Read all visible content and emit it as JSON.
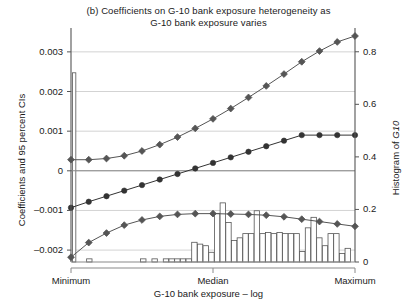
{
  "chart_data": {
    "type": "line",
    "title": "(b)  Coefficients on G-10 bank exposure heterogeneity as",
    "title_line1": "(b)  Coefficients on G-10 bank exposure heterogeneity as",
    "title_line2": "G-10 bank exposure varies",
    "xlabel": "G-10 bank exposure – log",
    "ylabel": "Coefficients and 95 percent CIs",
    "ylabel_right": "Histogram of G10",
    "ylabel_right_plain": "Histogram of ",
    "ylabel_right_italic": "G10",
    "grid": true,
    "legend": "none",
    "xtick_labels": [
      "Minimum",
      "Median",
      "Maximum"
    ],
    "xtick_positions": [
      0,
      0.5,
      1
    ],
    "ylim_left": [
      -0.0023,
      0.0034
    ],
    "ytick_values_left": [
      0.003,
      0.002,
      0.001,
      0,
      -0.001,
      -0.002
    ],
    "ytick_labels_left": [
      "0.003",
      "0.002",
      "0.001",
      "0",
      "–0.001",
      "–0.002"
    ],
    "ylim_right": [
      0,
      0.86
    ],
    "ytick_values_right": [
      0.8,
      0.6,
      0.4,
      0.2,
      0
    ],
    "ytick_labels_right": [
      "0.8",
      "0.6",
      "0.4",
      "0.2",
      "0"
    ],
    "zero_line": 0,
    "series": [
      {
        "name": "Upper 95% CI",
        "marker": "diamond",
        "color": "#555555",
        "x": [
          0.0,
          0.0625,
          0.125,
          0.1875,
          0.25,
          0.3125,
          0.375,
          0.4375,
          0.5,
          0.5625,
          0.625,
          0.6875,
          0.75,
          0.8125,
          0.875,
          0.9375,
          1.0
        ],
        "values": [
          0.00028,
          0.00028,
          0.00031,
          0.00038,
          0.0005,
          0.00066,
          0.00085,
          0.00107,
          0.00131,
          0.00157,
          0.00185,
          0.00214,
          0.00244,
          0.00275,
          0.00302,
          0.00325,
          0.0034
        ]
      },
      {
        "name": "Coefficient",
        "marker": "circle",
        "color": "#333333",
        "x": [
          0.0,
          0.0625,
          0.125,
          0.1875,
          0.25,
          0.3125,
          0.375,
          0.4375,
          0.5,
          0.5625,
          0.625,
          0.6875,
          0.75,
          0.8125,
          0.875,
          0.9375,
          1.0
        ],
        "values": [
          -0.00093,
          -0.00078,
          -0.00064,
          -0.0005,
          -0.00036,
          -0.00022,
          -8e-05,
          6e-05,
          0.0002,
          0.00034,
          0.00048,
          0.00062,
          0.00076,
          0.0009,
          0.0009,
          0.0009,
          0.0009
        ]
      },
      {
        "name": "Lower 95% CI",
        "marker": "diamond",
        "color": "#555555",
        "x": [
          0.0,
          0.0625,
          0.125,
          0.1875,
          0.25,
          0.3125,
          0.375,
          0.4375,
          0.5,
          0.5625,
          0.625,
          0.6875,
          0.75,
          0.8125,
          0.875,
          0.9375,
          1.0
        ],
        "values": [
          -0.00218,
          -0.00181,
          -0.00157,
          -0.00137,
          -0.00124,
          -0.00115,
          -0.0011,
          -0.00108,
          -0.00108,
          -0.00109,
          -0.0011,
          -0.00112,
          -0.00116,
          -0.00122,
          -0.00128,
          -0.00134,
          -0.0014
        ]
      }
    ],
    "histogram": {
      "name": "Histogram of G10",
      "axis": "right",
      "fill": "#ffffff",
      "stroke": "#555555",
      "bin_left_fractions": [
        0.005,
        0.055,
        0.245,
        0.285,
        0.325,
        0.345,
        0.365,
        0.385,
        0.405,
        0.425,
        0.445,
        0.465,
        0.485,
        0.505,
        0.525,
        0.545,
        0.565,
        0.585,
        0.605,
        0.625,
        0.645,
        0.665,
        0.685,
        0.705,
        0.725,
        0.745,
        0.765,
        0.785,
        0.805,
        0.825,
        0.845,
        0.865,
        0.885,
        0.905,
        0.925,
        0.945,
        0.965
      ],
      "bin_width_fraction": 0.019,
      "values": [
        0.72,
        0.012,
        0.012,
        0.012,
        0.012,
        0.012,
        0.012,
        0.012,
        0.012,
        0.075,
        0.068,
        0.062,
        0.037,
        0.185,
        0.225,
        0.15,
        0.082,
        0.092,
        0.108,
        0.108,
        0.195,
        0.108,
        0.112,
        0.108,
        0.112,
        0.108,
        0.108,
        0.108,
        0.04,
        0.13,
        0.17,
        0.092,
        0.062,
        0.108,
        0.108,
        0.032,
        0.052
      ],
      "first_bar_width_fraction": 0.012
    }
  }
}
